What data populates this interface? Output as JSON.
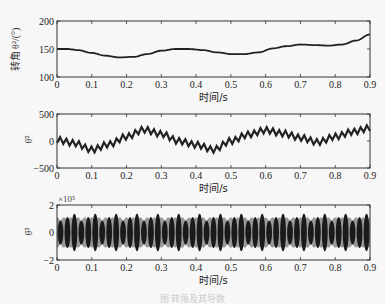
{
  "figure": {
    "caption": "图 转角及其导数",
    "x_axis_label": "时间/s"
  },
  "chart_data": [
    {
      "type": "line",
      "panel": "top",
      "title": "",
      "xlabel": "时间/s",
      "ylabel": "转角 θ²/(°)",
      "xlim": [
        0,
        0.9
      ],
      "ylim": [
        100,
        200
      ],
      "xticks": [
        "0",
        "0.1",
        "0.2",
        "0.3",
        "0.4",
        "0.5",
        "0.6",
        "0.7",
        "0.8",
        "0.9"
      ],
      "yticks": [
        "100",
        "150",
        "200"
      ],
      "grid": false,
      "series": [
        {
          "name": "转角",
          "x": [
            0,
            0.03,
            0.06,
            0.1,
            0.14,
            0.18,
            0.22,
            0.26,
            0.3,
            0.34,
            0.38,
            0.42,
            0.46,
            0.5,
            0.54,
            0.58,
            0.62,
            0.66,
            0.7,
            0.74,
            0.78,
            0.82,
            0.86,
            0.9
          ],
          "y": [
            150,
            150,
            148,
            143,
            138,
            135,
            136,
            141,
            147,
            150,
            150,
            148,
            144,
            141,
            141,
            144,
            151,
            155,
            158,
            157,
            156,
            158,
            165,
            176
          ]
        }
      ]
    },
    {
      "type": "line",
      "panel": "middle",
      "title": "",
      "xlabel": "时间/s",
      "ylabel": "θ̇²",
      "xlim": [
        0,
        0.9
      ],
      "ylim": [
        -500,
        500
      ],
      "xticks": [
        "0",
        "0.1",
        "0.2",
        "0.3",
        "0.4",
        "0.5",
        "0.6",
        "0.7",
        "0.8",
        "0.9"
      ],
      "yticks": [
        "-500",
        "0",
        "500"
      ],
      "grid": false,
      "series": [
        {
          "name": "角速度",
          "trend_x": [
            0,
            0.05,
            0.1,
            0.15,
            0.2,
            0.25,
            0.3,
            0.35,
            0.4,
            0.45,
            0.5,
            0.55,
            0.6,
            0.65,
            0.7,
            0.75,
            0.8,
            0.85,
            0.9
          ],
          "trend_y": [
            20,
            -40,
            -160,
            -60,
            80,
            210,
            130,
            0,
            -70,
            -160,
            0,
            120,
            200,
            140,
            60,
            -20,
            80,
            170,
            240
          ],
          "ripple_amplitude": 55,
          "ripple_period_s": 0.018
        }
      ]
    },
    {
      "type": "line",
      "panel": "bottom",
      "title": "",
      "xlabel": "时间/s",
      "ylabel": "θ̈²",
      "xlim": [
        0,
        0.9
      ],
      "ylim": [
        -2,
        2
      ],
      "y_multiplier": "×10⁵",
      "xticks": [
        "0",
        "0.1",
        "0.2",
        "0.3",
        "0.4",
        "0.5",
        "0.6",
        "0.7",
        "0.8",
        "0.9"
      ],
      "yticks": [
        "-2",
        "0",
        "2"
      ],
      "grid": false,
      "series": [
        {
          "name": "角加速度",
          "description": "dense oscillation centered at 0, envelope approx ±1.1×10⁵ with beating",
          "envelope_max": 1.1,
          "envelope_min": -1.1,
          "beat_period_s": 0.04
        }
      ]
    }
  ],
  "colors": {
    "line": "#222222",
    "band": "#888888",
    "axis": "#333333",
    "background": "#f7f7f7"
  }
}
